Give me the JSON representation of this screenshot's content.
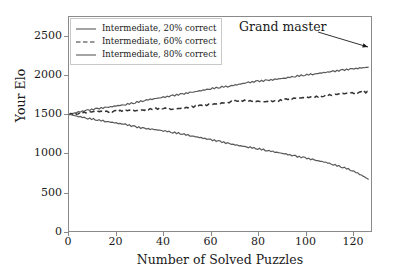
{
  "chart_data": {
    "type": "line",
    "title": "",
    "xlabel": "Number of Solved Puzzles",
    "ylabel": "Your Elo",
    "xlim": [
      0,
      128
    ],
    "ylim": [
      0,
      2750
    ],
    "xticks": [
      0,
      20,
      40,
      60,
      80,
      100,
      120
    ],
    "yticks": [
      0,
      500,
      1000,
      1500,
      2000,
      2500
    ],
    "xtick_labels": [
      "0",
      "20",
      "40",
      "60",
      "80",
      "100",
      "120"
    ],
    "ytick_labels": [
      "0",
      "500",
      "1000",
      "1500",
      "2000",
      "2500"
    ],
    "grid": false,
    "legend_position": "upper left",
    "annotations": [
      {
        "text": "Grand master",
        "x": 105,
        "y": 2580,
        "arrow_to_x": 127,
        "arrow_to_y": 2430
      }
    ],
    "series": [
      {
        "name": "Intermediate, 20% correct",
        "style": "solid",
        "color": "#5a5a5a",
        "x": [
          0,
          4,
          8,
          12,
          16,
          20,
          24,
          28,
          32,
          36,
          40,
          44,
          48,
          52,
          56,
          60,
          64,
          68,
          72,
          76,
          80,
          84,
          88,
          92,
          96,
          100,
          104,
          108,
          112,
          116,
          120,
          124,
          127
        ],
        "values": [
          1500,
          1528,
          1552,
          1572,
          1588,
          1608,
          1625,
          1650,
          1678,
          1700,
          1718,
          1740,
          1760,
          1782,
          1805,
          1828,
          1848,
          1862,
          1885,
          1908,
          1925,
          1935,
          1950,
          1968,
          1988,
          2005,
          2018,
          2035,
          2052,
          2068,
          2082,
          2095,
          2105
        ]
      },
      {
        "name": "Intermediate, 60% correct",
        "style": "dashed",
        "color": "#333333",
        "x": [
          0,
          4,
          8,
          12,
          16,
          20,
          24,
          28,
          32,
          36,
          40,
          44,
          48,
          52,
          56,
          60,
          64,
          68,
          72,
          76,
          80,
          84,
          88,
          92,
          96,
          100,
          104,
          108,
          112,
          116,
          120,
          124,
          127
        ],
        "values": [
          1500,
          1512,
          1528,
          1538,
          1532,
          1540,
          1552,
          1545,
          1558,
          1570,
          1578,
          1565,
          1578,
          1595,
          1612,
          1625,
          1640,
          1658,
          1678,
          1672,
          1668,
          1660,
          1672,
          1692,
          1705,
          1715,
          1722,
          1738,
          1752,
          1765,
          1772,
          1782,
          1785
        ]
      },
      {
        "name": "Intermediate, 80% correct",
        "style": "solid",
        "color": "#5a5a5a",
        "x": [
          0,
          4,
          8,
          12,
          16,
          20,
          24,
          28,
          32,
          36,
          40,
          44,
          48,
          52,
          56,
          60,
          64,
          68,
          72,
          76,
          80,
          84,
          88,
          92,
          96,
          100,
          104,
          108,
          112,
          116,
          120,
          124,
          127
        ],
        "values": [
          1500,
          1472,
          1448,
          1428,
          1408,
          1388,
          1368,
          1340,
          1318,
          1305,
          1288,
          1268,
          1248,
          1222,
          1198,
          1172,
          1150,
          1122,
          1098,
          1078,
          1058,
          1035,
          1012,
          988,
          962,
          940,
          912,
          888,
          855,
          820,
          778,
          718,
          662
        ]
      }
    ]
  },
  "legend": {
    "entries": [
      {
        "label": "Intermediate, 20% correct"
      },
      {
        "label": "Intermediate, 60% correct"
      },
      {
        "label": "Intermediate, 80% correct"
      }
    ]
  },
  "axis": {
    "ylabel": "Your Elo",
    "xlabel": "Number of Solved Puzzles"
  },
  "annotation": {
    "label": "Grand master"
  }
}
